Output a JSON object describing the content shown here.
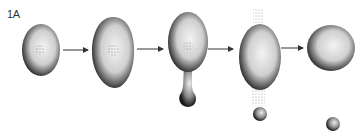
{
  "figure": {
    "label": "1A",
    "stages": [
      {
        "id": "stage-1",
        "shape": "oval-cell-with-nucleus"
      },
      {
        "id": "stage-2",
        "shape": "enlarged-egg-cell-with-nucleus"
      },
      {
        "id": "stage-3",
        "shape": "cell-with-budding-stalk"
      },
      {
        "id": "stage-4",
        "shape": "cell-releasing-particles-and-small-sphere"
      },
      {
        "id": "stage-5",
        "shape": "spherical-cell-with-separated-small-sphere"
      }
    ],
    "arrows": 4,
    "colors": {
      "background": "#ffffff",
      "cell_dark": "#1a1a1a",
      "cell_light": "#f2f2f2",
      "arrow": "#333333"
    }
  }
}
